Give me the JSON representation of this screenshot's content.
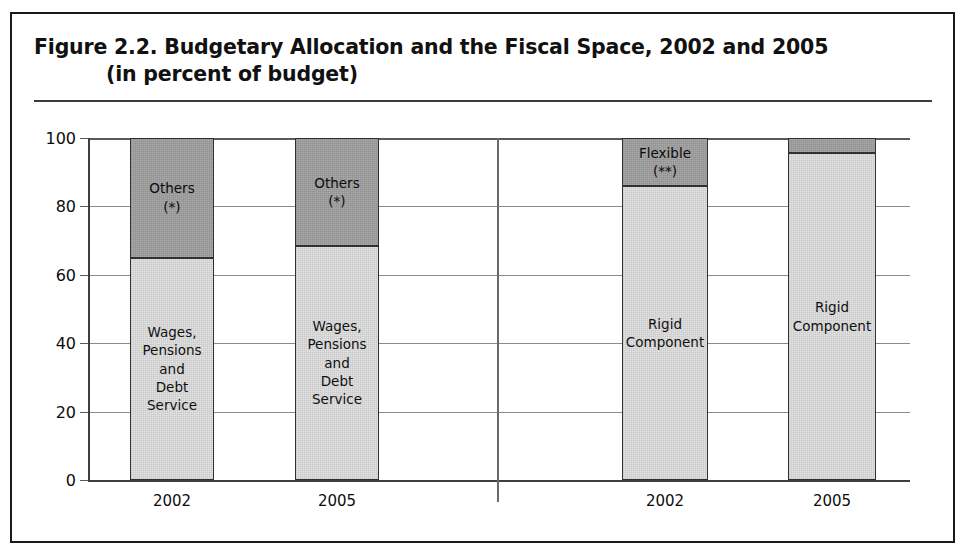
{
  "figure": {
    "title_line_1": "Figure 2.2.  Budgetary Allocation and the Fiscal Space, 2002 and 2005",
    "title_line_2": "(in percent of budget)"
  },
  "chart_data": {
    "type": "bar",
    "title": "Figure 2.2.  Budgetary Allocation and the Fiscal Space, 2002 and 2005 (in percent of budget)",
    "subtitle": "(in percent of budget)",
    "stacked": true,
    "xlabel": "",
    "ylabel": "",
    "ylim": [
      0,
      100
    ],
    "yticks": [
      0,
      20,
      40,
      60,
      80,
      100
    ],
    "ytick_labels": [
      "0",
      "20",
      "40",
      "60",
      "80",
      "100"
    ],
    "grid": true,
    "legend": "none",
    "categories": [
      "2002",
      "2005",
      "2002",
      "2005"
    ],
    "groups": [
      {
        "name": "Budgetary Allocation",
        "categories": [
          "2002",
          "2005"
        ]
      },
      {
        "name": "Fiscal Space",
        "categories": [
          "2002",
          "2005"
        ]
      }
    ],
    "bars": [
      {
        "category": "2002",
        "group": "Budgetary Allocation",
        "segments": [
          {
            "label": "Wages,\nPensions\nand\nDebt Service",
            "value": 65,
            "shade": "light"
          },
          {
            "label": "Others\n(*)",
            "value": 35,
            "shade": "dark"
          }
        ]
      },
      {
        "category": "2005",
        "group": "Budgetary Allocation",
        "segments": [
          {
            "label": "Wages,\nPensions\nand\nDebt Service",
            "value": 68.5,
            "shade": "light"
          },
          {
            "label": "Others\n(*)",
            "value": 31.5,
            "shade": "dark"
          }
        ]
      },
      {
        "category": "2002",
        "group": "Fiscal Space",
        "segments": [
          {
            "label": "Rigid\nComponent",
            "value": 86,
            "shade": "light"
          },
          {
            "label": "Flexible\n(**)",
            "value": 14,
            "shade": "dark"
          }
        ]
      },
      {
        "category": "2005",
        "group": "Fiscal Space",
        "segments": [
          {
            "label": "Rigid\nComponent",
            "value": 95.5,
            "shade": "light"
          },
          {
            "label": "",
            "value": 4.5,
            "shade": "dark"
          }
        ]
      }
    ],
    "colors": {
      "light_segment": "#e2e2e2",
      "dark_segment": "#9d9d9d",
      "segment_border": "#303030",
      "axis": "#3f3f3f",
      "gridline": "#8a8a8a",
      "text": "#0d0d0d",
      "frame": "#1a1a1a",
      "background": "#ffffff"
    }
  }
}
